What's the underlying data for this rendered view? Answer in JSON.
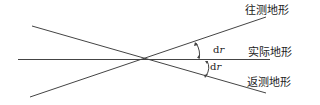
{
  "diagram": {
    "labels": {
      "forward": "往测地形",
      "actual": "实际地形",
      "backward": "返测地形"
    },
    "angle_labels": {
      "upper_d": "d",
      "upper_r": "r",
      "lower_d": "d",
      "lower_r": "r"
    },
    "colors": {
      "line": "#444444",
      "text": "#222222"
    }
  }
}
